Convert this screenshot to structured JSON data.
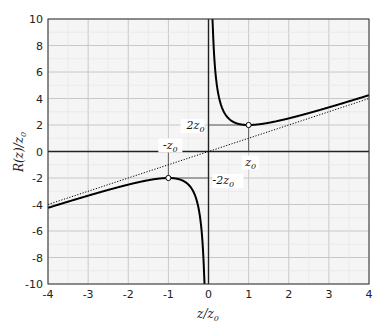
{
  "chart_data": {
    "type": "line",
    "title": "",
    "xlabel": "z/z0",
    "ylabel": "R(z)/z0",
    "xlim": [
      -4,
      4
    ],
    "ylim": [
      -10,
      10
    ],
    "xticks": [
      -4,
      -3,
      -2,
      -1,
      0,
      1,
      2,
      3,
      4
    ],
    "yticks": [
      -10,
      -8,
      -6,
      -4,
      -2,
      0,
      2,
      4,
      6,
      8,
      10
    ],
    "grid": true,
    "legend": null,
    "series": [
      {
        "name": "R(z)/z0 = z/z0 + z0/z",
        "style": "solid",
        "color": "#000000",
        "x": [
          -4,
          -3,
          -2,
          -1,
          -0.5,
          -0.2,
          -0.1,
          0.1,
          0.2,
          0.5,
          1,
          2,
          3,
          4
        ],
        "y": [
          -4.25,
          -3.33,
          -2.5,
          -2,
          -2.5,
          -5.2,
          -10.1,
          10.1,
          5.2,
          2.5,
          2,
          2.5,
          3.33,
          4.25
        ]
      },
      {
        "name": "asymptote R = z",
        "style": "dotted",
        "color": "#000000",
        "x": [
          -4,
          4
        ],
        "y": [
          -4,
          4
        ]
      }
    ],
    "annotations": [
      {
        "text": "z0",
        "x": 1,
        "y": 0,
        "note": "marker at minimum x"
      },
      {
        "text": "2z0",
        "x": 0,
        "y": 2
      },
      {
        "text": "-z0",
        "x": -1,
        "y": 0
      },
      {
        "text": "-2z0",
        "x": 0,
        "y": -2
      },
      {
        "text": "min point",
        "x": 1,
        "y": 2,
        "marker": "open-circle"
      },
      {
        "text": "max point",
        "x": -1,
        "y": -2,
        "marker": "open-circle"
      }
    ]
  },
  "labels": {
    "xlabel_main": "z/z",
    "xlabel_sub": "0",
    "ylabel_main": "R(z)/z",
    "ylabel_sub": "0",
    "ann_z0": "z",
    "ann_2z0": "2z",
    "ann_mz0": "-z",
    "ann_m2z0": "-2z",
    "sub0": "0"
  }
}
